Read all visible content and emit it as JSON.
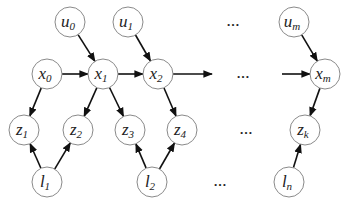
{
  "diagram": {
    "title": "",
    "nodes": [
      {
        "id": "u0",
        "var": "u",
        "sub": "0"
      },
      {
        "id": "u1",
        "var": "u",
        "sub": "1"
      },
      {
        "id": "um",
        "var": "u",
        "sub": "m"
      },
      {
        "id": "x0",
        "var": "x",
        "sub": "0"
      },
      {
        "id": "x1",
        "var": "x",
        "sub": "1"
      },
      {
        "id": "x2",
        "var": "x",
        "sub": "2"
      },
      {
        "id": "xm",
        "var": "x",
        "sub": "m"
      },
      {
        "id": "z1",
        "var": "z",
        "sub": "1"
      },
      {
        "id": "z2",
        "var": "z",
        "sub": "2"
      },
      {
        "id": "z3",
        "var": "z",
        "sub": "3"
      },
      {
        "id": "z4",
        "var": "z",
        "sub": "4"
      },
      {
        "id": "zk",
        "var": "z",
        "sub": "k"
      },
      {
        "id": "l1",
        "var": "l",
        "sub": "1"
      },
      {
        "id": "l2",
        "var": "l",
        "sub": "2"
      },
      {
        "id": "ln",
        "var": "l",
        "sub": "n"
      }
    ],
    "edges": [
      {
        "from": "u0",
        "to": "x1"
      },
      {
        "from": "u1",
        "to": "x2"
      },
      {
        "from": "um",
        "to": "xm"
      },
      {
        "from": "x0",
        "to": "x1"
      },
      {
        "from": "x1",
        "to": "x2"
      },
      {
        "from": "x2",
        "to": "continuation-right"
      },
      {
        "from": "continuation-left",
        "to": "xm"
      },
      {
        "from": "x0",
        "to": "z1"
      },
      {
        "from": "x1",
        "to": "z2"
      },
      {
        "from": "x1",
        "to": "z3"
      },
      {
        "from": "x2",
        "to": "z4"
      },
      {
        "from": "xm",
        "to": "zk"
      },
      {
        "from": "l1",
        "to": "z1"
      },
      {
        "from": "l1",
        "to": "z2"
      },
      {
        "from": "l2",
        "to": "z3"
      },
      {
        "from": "l2",
        "to": "z4"
      },
      {
        "from": "ln",
        "to": "zk"
      }
    ],
    "ellipsis": "…"
  }
}
